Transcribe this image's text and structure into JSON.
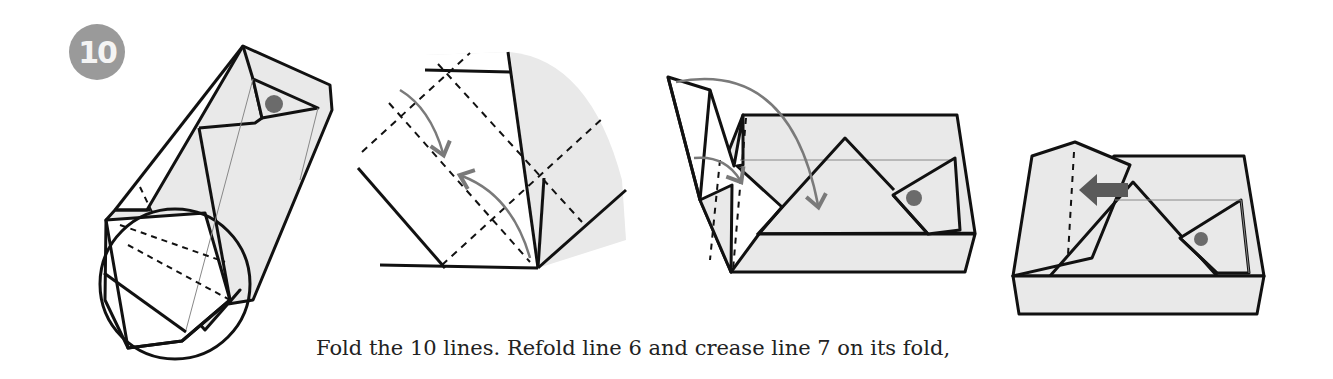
{
  "step": {
    "number": "10",
    "badge_color": "#9a9a9a"
  },
  "caption": "Fold the 10 lines. Refold line 6 and crease line 7 on its fold,",
  "figures": [
    {
      "id": "fig-a",
      "description": "Folded box base in diagonal view with circled detail region"
    },
    {
      "id": "fig-b",
      "description": "Magnified detail of circled region with dashed crease lines and curved fold arrows"
    },
    {
      "id": "fig-c",
      "description": "Box shape with side flaps and curved arrows showing tuck direction"
    },
    {
      "id": "fig-d",
      "description": "Completed box with flap and leftward push arrow"
    }
  ],
  "colors": {
    "paper_fill": "#e9e9e9",
    "line": "#111111",
    "arrow_gray": "#7a7a7a",
    "dot": "#6b6b6b"
  }
}
